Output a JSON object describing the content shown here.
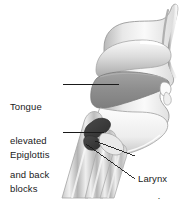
{
  "figure": {
    "type": "anatomical-illustration",
    "background_color": "#ffffff",
    "ink_color": "#1a1a1a",
    "palette": {
      "outline": "#8a8a8a",
      "tissue_light": "#f2f2f2",
      "tissue_mid": "#cfcfcf",
      "tissue_dark": "#9a9a9a",
      "cavity_gray": "#8f8f8f",
      "bolus_dark": "#3d3d3d",
      "leader_line": "#1a1a1a"
    }
  },
  "labels": {
    "tongue": {
      "line1": "Tongue",
      "line2": "elevated",
      "line3": "and back",
      "full_text": "Tongue elevated and back"
    },
    "epiglottis": {
      "line1": "Epiglottis",
      "line2": "blocks",
      "line3": "larynx",
      "full_text": "Epiglottis blocks larynx"
    },
    "larynx": {
      "line1": "Larynx",
      "line2": "elevated",
      "full_text": "Larynx elevated"
    },
    "food": {
      "line1": "Food",
      "full_text": "Food"
    }
  },
  "leaders": [
    {
      "name": "tongue-leader",
      "from": [
        63,
        84
      ],
      "to": [
        119,
        84
      ]
    },
    {
      "name": "epiglottis-leader",
      "from": [
        63,
        132
      ],
      "to": [
        104,
        132
      ]
    },
    {
      "name": "larynx-leader",
      "from": [
        126,
        156
      ],
      "to": [
        95,
        141
      ]
    },
    {
      "name": "food-leader",
      "from": [
        126,
        179
      ],
      "to": [
        86,
        144
      ]
    }
  ]
}
